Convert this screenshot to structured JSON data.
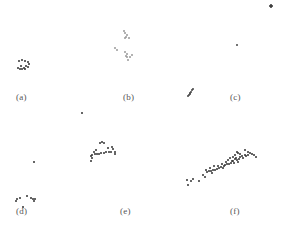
{
  "chart_data": [
    {
      "type": "scatter",
      "title": "(a)",
      "label_pos": [
        16,
        100
      ],
      "color": "#333333",
      "points": [
        [
          19,
          61
        ],
        [
          22,
          60
        ],
        [
          25,
          61
        ],
        [
          28,
          62
        ],
        [
          29,
          64
        ],
        [
          28,
          67
        ],
        [
          25,
          69
        ],
        [
          22,
          69
        ],
        [
          20,
          69
        ],
        [
          18,
          68
        ],
        [
          21,
          66
        ],
        [
          26,
          66
        ],
        [
          24,
          68
        ]
      ]
    },
    {
      "type": "scatter",
      "title": "(b)",
      "label_pos": [
        123,
        100
      ],
      "color": "#9a9a9a",
      "points": [
        [
          124,
          31
        ],
        [
          125,
          33
        ],
        [
          127,
          35
        ],
        [
          126,
          37
        ],
        [
          129,
          38
        ],
        [
          125,
          38
        ],
        [
          115,
          48
        ],
        [
          117,
          50
        ],
        [
          125,
          52
        ],
        [
          127,
          54
        ],
        [
          127,
          57
        ],
        [
          130,
          57
        ],
        [
          128,
          60
        ],
        [
          126,
          56
        ],
        [
          132,
          55
        ]
      ]
    },
    {
      "type": "scatter",
      "title": "(c)",
      "label_pos": [
        230,
        100
      ],
      "color": "#444444",
      "points": [
        [
          237,
          45
        ],
        [
          192,
          90
        ],
        [
          191,
          92
        ],
        [
          190,
          93
        ],
        [
          189,
          95
        ],
        [
          188,
          96
        ],
        [
          193,
          89
        ],
        [
          190,
          94
        ]
      ]
    },
    {
      "type": "scatter",
      "title": "(d)",
      "label_pos": [
        16,
        214
      ],
      "color": "#333333",
      "points": [
        [
          82,
          113
        ],
        [
          34,
          162
        ],
        [
          17,
          199
        ],
        [
          16,
          201
        ],
        [
          20,
          198
        ],
        [
          27,
          196
        ],
        [
          31,
          198
        ],
        [
          33,
          199
        ],
        [
          34,
          201
        ],
        [
          35,
          199
        ],
        [
          23,
          207
        ]
      ]
    },
    {
      "type": "scatter",
      "title": "(e)",
      "label_pos": [
        120,
        214
      ],
      "color": "#333333",
      "points": [
        [
          100,
          143
        ],
        [
          102,
          142
        ],
        [
          104,
          143
        ],
        [
          112,
          147
        ],
        [
          113,
          149
        ],
        [
          115,
          152
        ],
        [
          115,
          154
        ],
        [
          111,
          152
        ],
        [
          109,
          152
        ],
        [
          106,
          152
        ],
        [
          104,
          153
        ],
        [
          101,
          153
        ],
        [
          99,
          154
        ],
        [
          97,
          154
        ],
        [
          95,
          154
        ],
        [
          92,
          155
        ],
        [
          91,
          156
        ],
        [
          94,
          152
        ],
        [
          92,
          158
        ],
        [
          91,
          161
        ],
        [
          96,
          150
        ],
        [
          108,
          148
        ]
      ]
    },
    {
      "type": "scatter",
      "title": "(f)",
      "label_pos": [
        230,
        214
      ],
      "color": "#333333",
      "points": [
        [
          187,
          180
        ],
        [
          188,
          185
        ],
        [
          191,
          181
        ],
        [
          193,
          179
        ],
        [
          199,
          181
        ],
        [
          203,
          175
        ],
        [
          205,
          177
        ],
        [
          207,
          172
        ],
        [
          209,
          171
        ],
        [
          211,
          171
        ],
        [
          213,
          170
        ],
        [
          215,
          170
        ],
        [
          217,
          169
        ],
        [
          219,
          168
        ],
        [
          221,
          167
        ],
        [
          223,
          168
        ],
        [
          224,
          166
        ],
        [
          225,
          165
        ],
        [
          227,
          164
        ],
        [
          229,
          164
        ],
        [
          231,
          163
        ],
        [
          232,
          161
        ],
        [
          233,
          161
        ],
        [
          234,
          163
        ],
        [
          235,
          159
        ],
        [
          236,
          158
        ],
        [
          237,
          160
        ],
        [
          238,
          162
        ],
        [
          239,
          159
        ],
        [
          240,
          157
        ],
        [
          242,
          156
        ],
        [
          243,
          158
        ],
        [
          245,
          155
        ],
        [
          246,
          156
        ],
        [
          248,
          155
        ],
        [
          250,
          153
        ],
        [
          252,
          154
        ],
        [
          254,
          155
        ],
        [
          256,
          157
        ],
        [
          245,
          150
        ],
        [
          248,
          152
        ],
        [
          238,
          153
        ],
        [
          235,
          155
        ],
        [
          233,
          157
        ],
        [
          230,
          158
        ],
        [
          228,
          160
        ],
        [
          226,
          162
        ],
        [
          222,
          164
        ],
        [
          218,
          166
        ],
        [
          214,
          166
        ],
        [
          210,
          168
        ],
        [
          206,
          170
        ],
        [
          237,
          152
        ],
        [
          240,
          154
        ],
        [
          212,
          173
        ]
      ]
    }
  ],
  "corner_mark": {
    "points": [
      [
        270,
        6
      ],
      [
        271,
        7
      ],
      [
        272,
        6
      ],
      [
        271,
        5
      ]
    ],
    "color": "#333333"
  },
  "panel_labels": [
    "(a)",
    "(b)",
    "(c)",
    "(d)",
    "(e)",
    "(f)"
  ]
}
